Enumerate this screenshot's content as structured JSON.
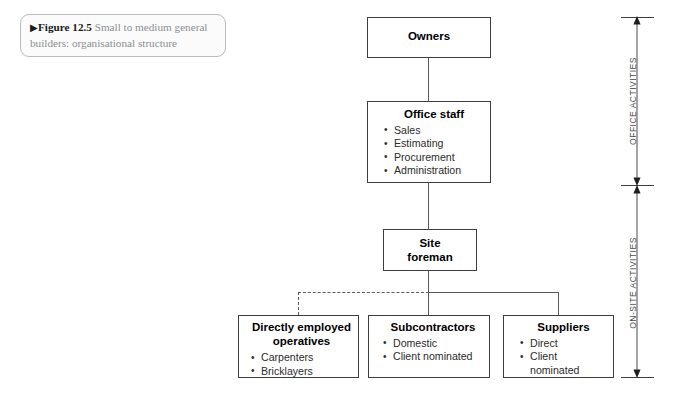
{
  "figure": {
    "marker_icon": "right-triangle-icon",
    "marker_glyph": "▶",
    "number_label": "Figure 12.5",
    "caption_text": "Small to medium general builders: organisational structure"
  },
  "diagram": {
    "type": "organisational-chart",
    "nodes": [
      {
        "id": "owners",
        "title": "Owners",
        "items": []
      },
      {
        "id": "office-staff",
        "title": "Office staff",
        "items": [
          "Sales",
          "Estimating",
          "Procurement",
          "Administration"
        ]
      },
      {
        "id": "site-foreman",
        "title_line1": "Site",
        "title_line2": "foreman",
        "items": []
      },
      {
        "id": "directly-employed-operatives",
        "title_line1": "Directly employed",
        "title_line2": "operatives",
        "items": [
          "Carpenters",
          "Bricklayers"
        ]
      },
      {
        "id": "subcontractors",
        "title": "Subcontractors",
        "items": [
          "Domestic",
          "Client nominated"
        ]
      },
      {
        "id": "suppliers",
        "title": "Suppliers",
        "items": [
          "Direct",
          "Client nominated"
        ]
      }
    ],
    "scale": {
      "upper_label": "OFFICE ACTIVITIES",
      "lower_label": "ON-SITE ACTIVITIES"
    }
  },
  "colors": {
    "box_border": "#3d3d3d",
    "connector": "#5a5a5a",
    "caption_border": "#b9bcbe",
    "caption_text": "#8b8f93",
    "page_background": "#ffffff"
  }
}
